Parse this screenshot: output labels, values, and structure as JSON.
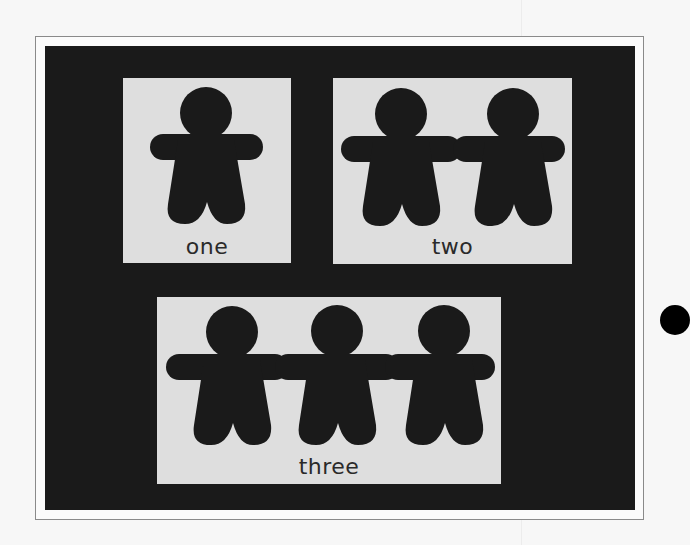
{
  "page": {
    "background": "#f7f7f7",
    "board_color": "#1a1a1a",
    "card_color": "#dedede",
    "figure_color": "#1a1a1a"
  },
  "cards": [
    {
      "label": "one",
      "figure_count": 1
    },
    {
      "label": "two",
      "figure_count": 2
    },
    {
      "label": "three",
      "figure_count": 3
    }
  ],
  "decorations": {
    "bullet_dot": "black-dot"
  }
}
